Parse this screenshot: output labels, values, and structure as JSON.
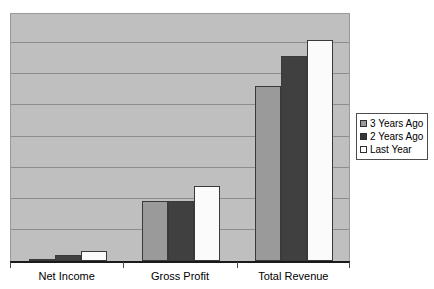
{
  "chart_data": {
    "type": "bar",
    "title": "",
    "subtitle": "",
    "xlabel": "",
    "ylabel": "",
    "categories": [
      "Net Income",
      "Gross Profit",
      "Total Revenue"
    ],
    "series": [
      {
        "name": "3 Years Ago",
        "color": "#9a9a9a",
        "values": [
          0.06,
          1.93,
          5.63
        ]
      },
      {
        "name": "2 Years Ago",
        "color": "#404040",
        "values": [
          0.19,
          1.93,
          6.59
        ]
      },
      {
        "name": "Last Year",
        "color": "#fbfbfb",
        "values": [
          0.32,
          2.41,
          7.11
        ]
      }
    ],
    "ylim": [
      0,
      8
    ],
    "y_gridline_values": [
      1,
      2,
      3,
      4,
      5,
      6,
      7
    ],
    "y_tick_labels": [],
    "grid": true,
    "grid_color": "#8d8d8d",
    "plot_background": "#bfbfbf",
    "legend_position": "right"
  },
  "legend": {
    "entries": [
      {
        "label": "3 Years Ago"
      },
      {
        "label": "2 Years Ago"
      },
      {
        "label": "Last Year"
      }
    ]
  },
  "axis": {
    "x_labels": [
      "Net Income",
      "Gross Profit",
      "Total Revenue"
    ]
  }
}
